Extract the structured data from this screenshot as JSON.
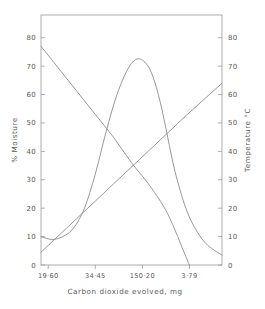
{
  "chart_data": {
    "type": "line",
    "title": "",
    "subtitle": "",
    "xlabel": "Carbon dioxide evolved, mg",
    "ylabel": "% Moisture",
    "y2label": "Temperature °C",
    "xlim": [
      0,
      100
    ],
    "ylim": [
      0,
      88
    ],
    "y2lim": [
      0,
      88
    ],
    "grid": false,
    "legend": "none",
    "xtick_labels": [
      "19·60",
      "34·45",
      "150·20",
      "3·79"
    ],
    "xtick_positions": [
      4,
      30,
      56,
      82
    ],
    "ytick_labels": [
      "0",
      "10",
      "20",
      "30",
      "40",
      "50",
      "60",
      "70",
      "80"
    ],
    "ytick_values": [
      0,
      10,
      20,
      30,
      40,
      50,
      60,
      70,
      80
    ],
    "y2tick_labels": [
      "0",
      "10",
      "20",
      "30",
      "40",
      "50",
      "60",
      "70",
      "80"
    ],
    "y2tick_values": [
      0,
      10,
      20,
      30,
      40,
      50,
      60,
      70,
      80
    ],
    "series": [
      {
        "name": "% Moisture (declining)",
        "axis": "left",
        "x": [
          0,
          10,
          20,
          30,
          40,
          50,
          60,
          70,
          80,
          82
        ],
        "values": [
          77,
          69,
          61,
          53,
          45,
          36,
          28,
          18,
          3,
          0
        ]
      },
      {
        "name": "Temperature °C (rising)",
        "axis": "right",
        "x": [
          0,
          20,
          40,
          60,
          80,
          100
        ],
        "values": [
          4.5,
          16.5,
          28.5,
          40.5,
          52.5,
          64
        ]
      },
      {
        "name": "Carbon dioxide evolved (peak)",
        "axis": "left",
        "x": [
          0,
          6,
          12,
          18,
          24,
          30,
          36,
          42,
          48,
          53,
          58,
          62,
          66,
          70,
          74,
          80,
          86,
          92,
          100
        ],
        "values": [
          10,
          9,
          10,
          13,
          20,
          32,
          47,
          60,
          69,
          72.5,
          71,
          66,
          57,
          45,
          33,
          20,
          12,
          7,
          3.5
        ]
      }
    ]
  },
  "axes": {
    "left_title": "% Moisture",
    "right_title": "Temperature °C",
    "bottom_title": "Carbon dioxide evolved, mg"
  }
}
